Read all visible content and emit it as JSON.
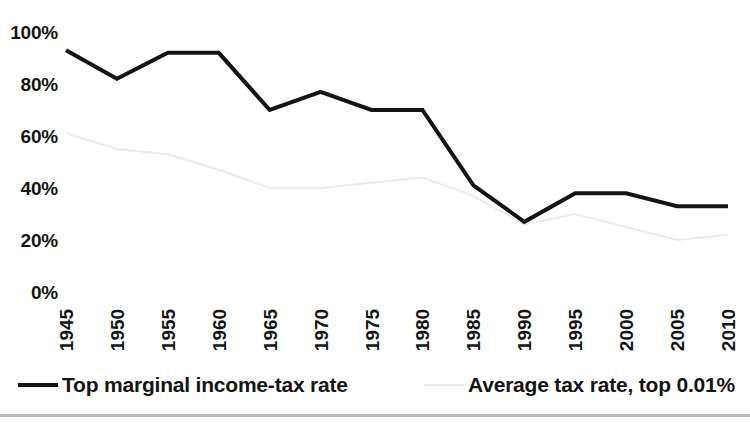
{
  "chart_data": {
    "type": "line",
    "title": "",
    "subtitle": "",
    "xlabel": "",
    "ylabel": "",
    "categories": [
      "1945",
      "1950",
      "1955",
      "1960",
      "1965",
      "1970",
      "1975",
      "1980",
      "1985",
      "1990",
      "1995",
      "2000",
      "2005",
      "2010"
    ],
    "x": [
      1945,
      1950,
      1955,
      1960,
      1965,
      1970,
      1975,
      1980,
      1985,
      1990,
      1995,
      2000,
      2005,
      2010
    ],
    "ylim": [
      0,
      100
    ],
    "yticks": [
      0,
      20,
      40,
      60,
      80,
      100
    ],
    "ytick_labels": [
      "0%",
      "20%",
      "40%",
      "60%",
      "80%",
      "100%"
    ],
    "grid": false,
    "legend_position": "bottom",
    "series": [
      {
        "name": "Top marginal income-tax rate",
        "color": "#141414",
        "width": 4,
        "values": [
          93,
          82,
          92,
          92,
          70,
          77,
          70,
          70,
          41,
          27,
          38,
          38,
          33,
          33
        ]
      },
      {
        "name": "Average tax rate, top 0.01%",
        "color": "#ededed",
        "width": 2,
        "values": [
          61,
          55,
          53,
          47,
          40,
          40,
          42,
          44,
          37,
          26,
          30,
          25,
          20,
          22
        ]
      }
    ]
  },
  "legend": {
    "entries": [
      {
        "label": "Top marginal income-tax rate"
      },
      {
        "label": "Average tax rate, top 0.01%"
      }
    ]
  }
}
